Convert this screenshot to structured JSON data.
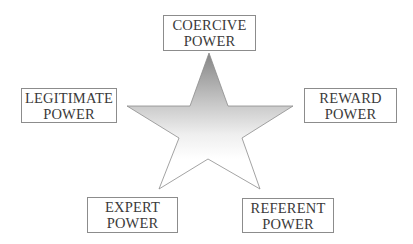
{
  "diagram": {
    "title": "",
    "center_shape": {
      "type": "star",
      "points": 5,
      "fill_gradient": {
        "top": "#858585",
        "middle": "#e6e6e6",
        "bottom": "#ffffff"
      },
      "stroke": "#8c8c8c"
    },
    "nodes": [
      {
        "id": "coercive",
        "line1": "COERCIVE",
        "line2": "POWER",
        "position": "top"
      },
      {
        "id": "legitimate",
        "line1": "LEGITIMATE",
        "line2": "POWER",
        "position": "left"
      },
      {
        "id": "reward",
        "line1": "REWARD",
        "line2": "POWER",
        "position": "right"
      },
      {
        "id": "expert",
        "line1": "EXPERT",
        "line2": "POWER",
        "position": "bottom-left"
      },
      {
        "id": "referent",
        "line1": "REFERENT",
        "line2": "POWER",
        "position": "bottom-right"
      }
    ]
  }
}
